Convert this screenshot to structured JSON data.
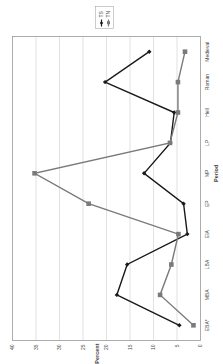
{
  "chart_data": {
    "type": "line",
    "title": "",
    "xlabel": "Period",
    "ylabel": "Percent",
    "ylim": [
      0,
      40
    ],
    "yticks": [
      0,
      5,
      10,
      15,
      20,
      25,
      30,
      35,
      40
    ],
    "grid": true,
    "legend_position": "right",
    "orientation_note": "figure rendered rotated 90 degrees",
    "categories": [
      "EBA*",
      "MBA",
      "LBA",
      "EIA",
      "EP",
      "MP",
      "LP",
      "Hell",
      "Roman",
      "Medieval"
    ],
    "series": [
      {
        "name": "TS",
        "marker": "diamond",
        "color": "#1a1a1a",
        "values": [
          4.5,
          17.8,
          15.6,
          2.8,
          3.6,
          12.0,
          6.4,
          5.6,
          20.3,
          10.9
        ]
      },
      {
        "name": "TN",
        "marker": "square",
        "color": "#7a7a7a",
        "values": [
          1.5,
          8.6,
          6.2,
          4.7,
          23.8,
          35.3,
          6.5,
          4.8,
          4.8,
          3.3
        ]
      }
    ]
  },
  "labels": {
    "xlabel": "Period",
    "ylabel": "Percent",
    "legend": [
      "TS",
      "TN"
    ]
  }
}
